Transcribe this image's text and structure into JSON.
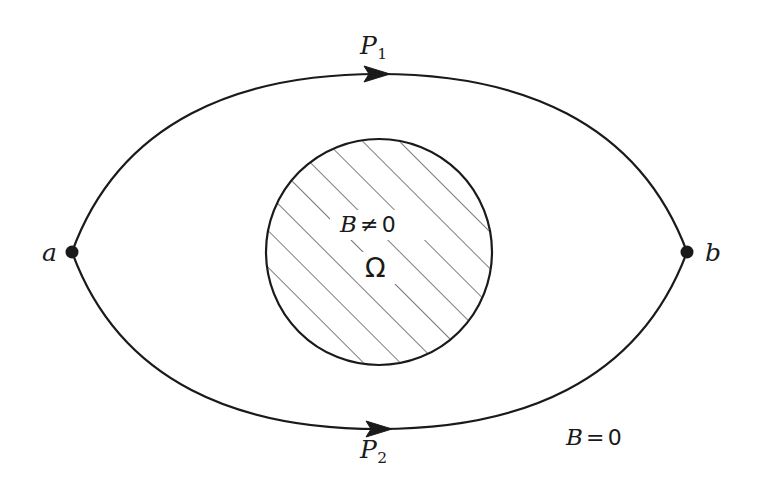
{
  "figure": {
    "background_color": "#ffffff",
    "stroke_color": "#1a1a1a",
    "hatch_color": "#444444",
    "width": 759,
    "height": 493
  },
  "points": [
    {
      "id": "a",
      "label": "a",
      "x": 72,
      "y": 252,
      "label_x": 42,
      "label_y": 240
    },
    {
      "id": "b",
      "label": "b",
      "x": 687,
      "y": 252,
      "label_x": 705,
      "label_y": 240
    }
  ],
  "paths": [
    {
      "id": "P1",
      "label": "P",
      "subscript": "1",
      "direction": "rightward",
      "description": "upper arc from a to b",
      "label_x": 360,
      "label_y": 33,
      "arrow_x": 378,
      "arrow_y": 76
    },
    {
      "id": "P2",
      "label": "P",
      "subscript": "2",
      "direction": "rightward",
      "description": "lower arc from a to b",
      "label_x": 360,
      "label_y": 437,
      "arrow_x": 378,
      "arrow_y": 426
    }
  ],
  "regions": {
    "inner": {
      "id": "omega",
      "shape": "circle",
      "center_x": 379,
      "center_y": 252,
      "radius": 113,
      "fill": "hatched",
      "hatch_angle_deg": 45,
      "field_label": {
        "sym": "B",
        "op": "≠",
        "value": "0",
        "x": 340,
        "y": 213
      },
      "region_label": {
        "text": "Ω",
        "x": 365,
        "y": 254
      }
    },
    "outer": {
      "id": "field-free",
      "field_label": {
        "sym": "B",
        "op": "=",
        "value": "0",
        "x": 566,
        "y": 426
      }
    }
  }
}
